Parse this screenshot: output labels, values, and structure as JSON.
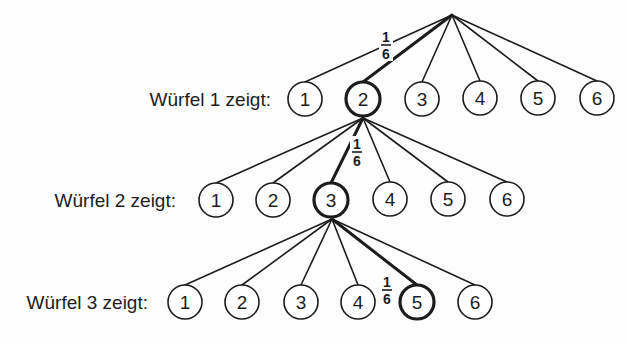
{
  "diagram": {
    "type": "probability-tree",
    "root": {
      "x": 452,
      "y": 15
    },
    "node_radius": 17,
    "line_color": "#1c1c1c",
    "levels": [
      {
        "label": "Würfel 1 zeigt:",
        "label_pos": {
          "x": 271,
          "y": 106
        },
        "origin": {
          "x": 452,
          "y": 15
        },
        "nodes": [
          {
            "value": "1",
            "x": 305,
            "y": 99
          },
          {
            "value": "2",
            "x": 363,
            "y": 99
          },
          {
            "value": "3",
            "x": 422,
            "y": 99
          },
          {
            "value": "4",
            "x": 480,
            "y": 98
          },
          {
            "value": "5",
            "x": 538,
            "y": 98
          },
          {
            "value": "6",
            "x": 597,
            "y": 98
          }
        ],
        "highlighted": 1,
        "edge_probability": {
          "num": "1",
          "den": "6",
          "x": 386,
          "y": 45
        }
      },
      {
        "label": "Würfel 2 zeigt:",
        "label_pos": {
          "x": 176,
          "y": 207
        },
        "origin": {
          "x": 363,
          "y": 118
        },
        "nodes": [
          {
            "value": "1",
            "x": 216,
            "y": 200
          },
          {
            "value": "2",
            "x": 273,
            "y": 200
          },
          {
            "value": "3",
            "x": 331,
            "y": 200
          },
          {
            "value": "4",
            "x": 390,
            "y": 199
          },
          {
            "value": "5",
            "x": 448,
            "y": 199
          },
          {
            "value": "6",
            "x": 507,
            "y": 199
          }
        ],
        "highlighted": 2,
        "edge_probability": {
          "num": "1",
          "den": "6",
          "x": 357,
          "y": 152
        }
      },
      {
        "label": "Würfel 3 zeigt:",
        "label_pos": {
          "x": 148,
          "y": 309
        },
        "origin": {
          "x": 332,
          "y": 219
        },
        "nodes": [
          {
            "value": "1",
            "x": 185,
            "y": 302
          },
          {
            "value": "2",
            "x": 242,
            "y": 302
          },
          {
            "value": "3",
            "x": 301,
            "y": 302
          },
          {
            "value": "4",
            "x": 358,
            "y": 302
          },
          {
            "value": "5",
            "x": 417,
            "y": 302
          },
          {
            "value": "6",
            "x": 475,
            "y": 302
          }
        ],
        "highlighted": 4,
        "edge_probability": {
          "num": "1",
          "den": "6",
          "x": 387,
          "y": 290
        }
      }
    ]
  }
}
